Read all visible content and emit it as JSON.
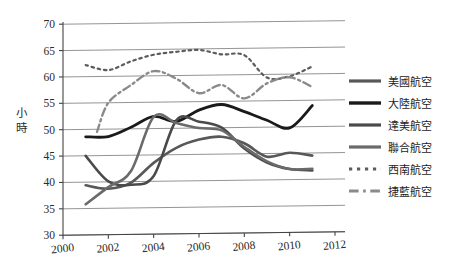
{
  "chart_data": {
    "type": "line",
    "title": "",
    "subtitle": "",
    "xlabel": "",
    "ylabel": "小時",
    "xlim": [
      2000,
      2012
    ],
    "ylim": [
      30,
      70
    ],
    "xticks": [
      2000,
      2002,
      2004,
      2006,
      2008,
      2010,
      2012
    ],
    "yticks": [
      30,
      35,
      40,
      45,
      50,
      55,
      60,
      65,
      70
    ],
    "grid": "horizontal",
    "legend_position": "right",
    "x": [
      2001,
      2002,
      2003,
      2004,
      2005,
      2006,
      2007,
      2008,
      2009,
      2010,
      2011
    ],
    "series": [
      {
        "name": "美國航空",
        "color": "#585858",
        "style": "solid",
        "width": 2.6,
        "x": [
          2001,
          2002,
          2003,
          2004,
          2005,
          2006,
          2007,
          2008,
          2009,
          2010,
          2011
        ],
        "values": [
          39.4,
          38.7,
          39.8,
          43.5,
          46.3,
          47.8,
          48.3,
          47.0,
          44.4,
          45.1,
          44.5
        ]
      },
      {
        "name": "大陸航空",
        "color": "#1a1a1a",
        "style": "solid",
        "width": 2.8,
        "x": [
          2001,
          2002,
          2003,
          2004,
          2005,
          2006,
          2007,
          2008,
          2009,
          2010,
          2011
        ],
        "values": [
          48.6,
          48.6,
          50.3,
          52.3,
          51.3,
          53.4,
          54.4,
          53.0,
          51.3,
          49.8,
          54.0
        ]
      },
      {
        "name": "達美航空",
        "color": "#4a4a4a",
        "style": "solid",
        "width": 2.6,
        "x": [
          2001,
          2002,
          2003,
          2004,
          2005,
          2006,
          2007,
          2008,
          2009,
          2010,
          2011
        ],
        "values": [
          45.0,
          40.1,
          39.4,
          41.0,
          51.5,
          51.2,
          50.0,
          46.0,
          43.3,
          42.0,
          41.7
        ]
      },
      {
        "name": "聯合航空",
        "color": "#6a6a6a",
        "style": "solid",
        "width": 2.6,
        "x": [
          2001,
          2002,
          2003,
          2004,
          2005,
          2006,
          2007,
          2008,
          2009,
          2010,
          2011
        ],
        "values": [
          35.8,
          39.0,
          42.0,
          52.2,
          51.0,
          50.0,
          49.5,
          46.3,
          43.5,
          42.0,
          42.0
        ]
      },
      {
        "name": "西南航空",
        "color": "#5c5c5c",
        "style": "dotted",
        "width": 2.2,
        "x": [
          2001,
          2002,
          2003,
          2004,
          2005,
          2006,
          2007,
          2008,
          2009,
          2010,
          2011
        ],
        "values": [
          62.2,
          61.2,
          62.8,
          64.0,
          64.5,
          64.8,
          63.9,
          63.7,
          59.4,
          59.6,
          61.4
        ]
      },
      {
        "name": "捷藍航空",
        "color": "#8a8a8a",
        "style": "dashdot",
        "width": 2.4,
        "x": [
          2001.5,
          2002,
          2003,
          2004,
          2005,
          2006,
          2007,
          2008,
          2009,
          2010,
          2011
        ],
        "values": [
          49.5,
          55.0,
          58.3,
          60.9,
          59.4,
          56.6,
          58.1,
          55.5,
          58.3,
          59.4,
          57.5
        ]
      }
    ]
  },
  "axes": {
    "y_title_chars": [
      "小",
      "時"
    ],
    "y_tick_labels": [
      "70",
      "65",
      "60",
      "55",
      "50",
      "45",
      "40",
      "35",
      "30"
    ],
    "x_tick_labels": [
      "2000",
      "2002",
      "2004",
      "2006",
      "2008",
      "2010",
      "2012"
    ]
  },
  "legend": {
    "items": [
      {
        "label": "美國航空",
        "color": "#585858",
        "style": "solid"
      },
      {
        "label": "大陸航空",
        "color": "#1a1a1a",
        "style": "solid"
      },
      {
        "label": "達美航空",
        "color": "#4a4a4a",
        "style": "solid"
      },
      {
        "label": "聯合航空",
        "color": "#6a6a6a",
        "style": "solid"
      },
      {
        "label": "西南航空",
        "color": "#5c5c5c",
        "style": "dotted"
      },
      {
        "label": "捷藍航空",
        "color": "#8a8a8a",
        "style": "dashdot"
      }
    ]
  },
  "colors": {
    "background": "#ffffff",
    "gridline": "#888888",
    "axis": "#444444",
    "text": "#2a2a2a"
  }
}
